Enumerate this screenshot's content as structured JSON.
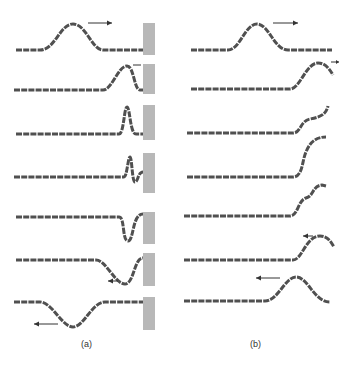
{
  "figure": {
    "panels": [
      {
        "id": "a",
        "label": "(a)",
        "description": "Pulse reflection at a fixed end (wall)",
        "frames": 7
      },
      {
        "id": "b",
        "label": "(b)",
        "description": "Pulse reflection at a free end",
        "frames": 7
      }
    ],
    "colors": {
      "rope": "#505050",
      "wall": "#b8b8b8",
      "arrow": "#333333",
      "background": "#ffffff"
    }
  }
}
